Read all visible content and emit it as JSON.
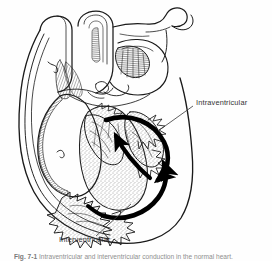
{
  "figure": {
    "kind": "anatomical-line-drawing",
    "style": "black ink line art on white background, hatched shading, stippled trabeculae",
    "background_color": "#ffffff",
    "ink_color": "#1a1a1a",
    "arrow_color": "#000000",
    "label_color": "#333333",
    "caption_color": "#8e8e8e"
  },
  "labels": {
    "intraventricular": "Intraventricular",
    "interventricular": "Interventricular"
  },
  "leaders": [
    {
      "name": "intraventricular-leader",
      "from_label": "Intraventricular",
      "points": "193,106 158,131"
    },
    {
      "name": "interventricular-leader",
      "from_label": "Interventricular",
      "points": "96,236 131,204"
    }
  ],
  "arrows": [
    {
      "name": "intraventricular-arrow",
      "label": "Intraventricular",
      "description": "thick curved arrow sweeping from upper-left septum down and right toward the right ventricular free wall"
    },
    {
      "name": "interventricular-arrow",
      "label": "Interventricular",
      "description": "thick curved arrow sweeping along the interventricular septum toward the apex"
    },
    {
      "name": "septal-upward-arrow",
      "label": "",
      "description": "thick arrow pointing up-left along the septum"
    }
  ],
  "caption": {
    "number": "Fig. 7-1",
    "text": "Intraventricular and interventricular conduction in the normal heart.",
    "clipped": true
  },
  "anatomy_parts": [
    "superior vena cava",
    "aorta / aortic arch",
    "pulmonary artery",
    "left atrium",
    "right atrium",
    "left ventricle",
    "right ventricle",
    "interventricular septum",
    "trabeculae carneae",
    "papillary muscles",
    "atrioventricular valves",
    "cardiac apex"
  ]
}
